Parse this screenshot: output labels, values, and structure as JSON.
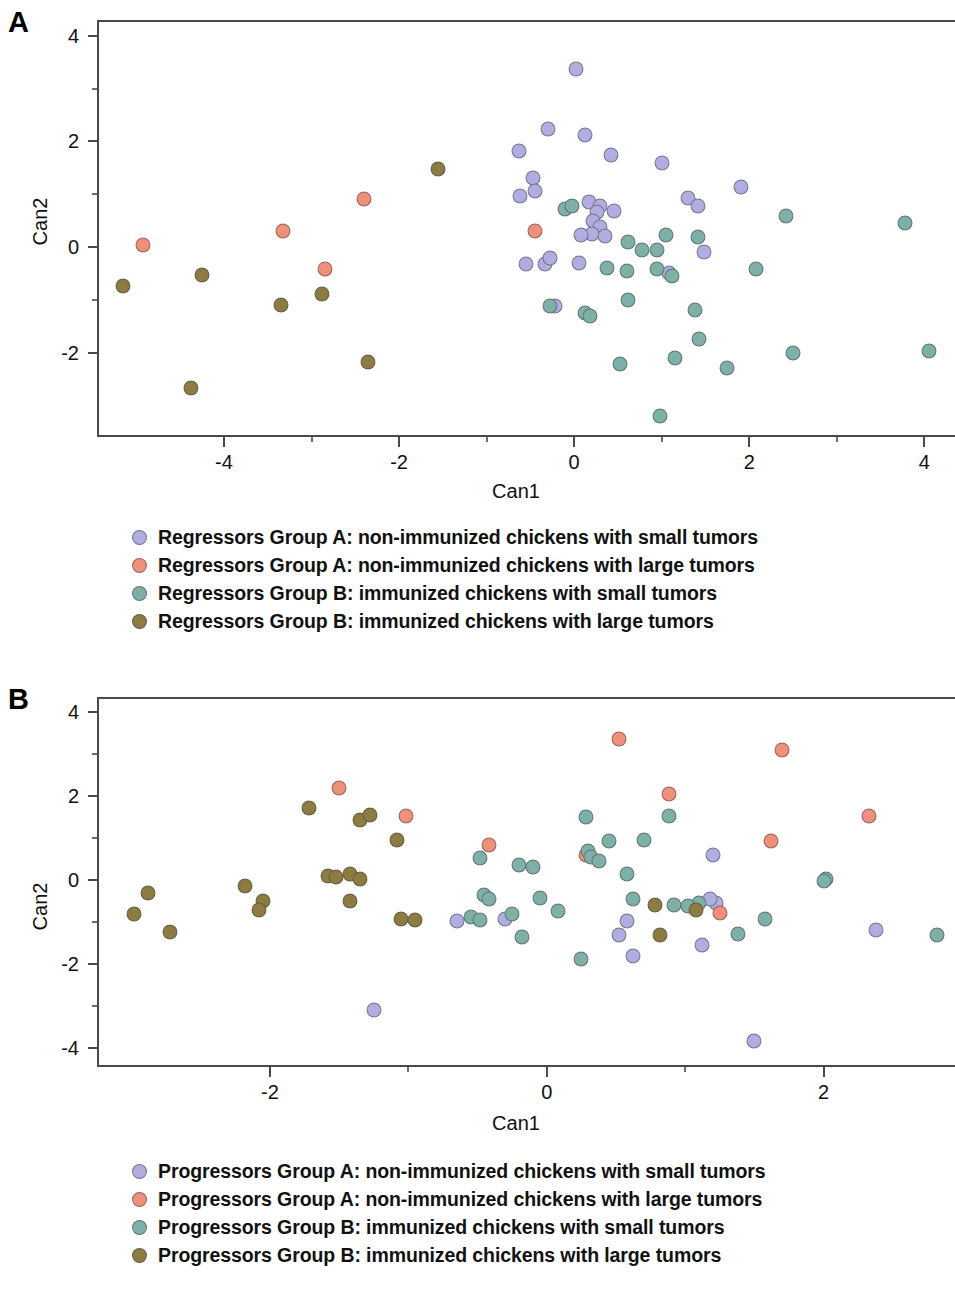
{
  "figure": {
    "panels": [
      {
        "letter": "A",
        "axes": {
          "xlabel": "Can1",
          "ylabel": "Can2",
          "xticks": [
            "-4",
            "-2",
            "0",
            "2",
            "4"
          ],
          "xtick_values": [
            -4,
            -2,
            0,
            2,
            4
          ],
          "yticks": [
            "4",
            "2",
            "0",
            "-2"
          ],
          "ytick_values": [
            4,
            2,
            0,
            -2
          ],
          "xlim": [
            -5.45,
            4.35
          ],
          "ylim": [
            -3.6,
            4.3
          ]
        },
        "legend": [
          {
            "label": "Regressors Group A: non-immunized chickens with small tumors",
            "color": "#b0aee0"
          },
          {
            "label": "Regressors Group A: non-immunized chickens with large tumors",
            "color": "#f08f7a"
          },
          {
            "label": "Regressors Group B: immunized chickens with small tumors",
            "color": "#7fb0a8"
          },
          {
            "label": "Regressors Group B: immunized chickens with large tumors",
            "color": "#8c7c42"
          }
        ]
      },
      {
        "letter": "B",
        "axes": {
          "xlabel": "Can1",
          "ylabel": "Can2",
          "xticks": [
            "-2",
            "0",
            "2"
          ],
          "xtick_values": [
            -2,
            0,
            2
          ],
          "yticks": [
            "4",
            "2",
            "0",
            "-2",
            "-4"
          ],
          "ytick_values": [
            4,
            2,
            0,
            -2,
            -4
          ],
          "xlim": [
            -3.25,
            2.95
          ],
          "ylim": [
            -4.45,
            4.35
          ]
        },
        "legend": [
          {
            "label": "Progressors Group A: non-immunized chickens with small tumors",
            "color": "#b0aee0"
          },
          {
            "label": "Progressors Group A: non-immunized chickens with large tumors",
            "color": "#f08f7a"
          },
          {
            "label": "Progressors Group B: immunized chickens with small tumors",
            "color": "#7fb0a8"
          },
          {
            "label": "Progressors Group B: immunized chickens with large tumors",
            "color": "#8c7c42"
          }
        ]
      }
    ]
  },
  "chart_data": [
    {
      "type": "scatter",
      "panel": "A",
      "title": "",
      "xlabel": "Can1",
      "ylabel": "Can2",
      "xlim": [
        -5.45,
        4.35
      ],
      "ylim": [
        -3.6,
        4.3
      ],
      "xticks": [
        -4,
        -2,
        0,
        2,
        4
      ],
      "yticks": [
        4,
        2,
        0,
        -2
      ],
      "grid": false,
      "legend_position": "below",
      "series": [
        {
          "name": "Regressors Group A: non-immunized chickens with small tumors",
          "color": "#b0aee0",
          "points": [
            [
              0.02,
              3.38
            ],
            [
              -0.3,
              2.24
            ],
            [
              0.12,
              2.13
            ],
            [
              -0.63,
              1.82
            ],
            [
              0.42,
              1.75
            ],
            [
              1.0,
              1.6
            ],
            [
              -0.47,
              1.3
            ],
            [
              1.9,
              1.13
            ],
            [
              -0.62,
              0.97
            ],
            [
              -0.45,
              1.06
            ],
            [
              1.3,
              0.92
            ],
            [
              1.42,
              0.77
            ],
            [
              0.17,
              0.85
            ],
            [
              0.3,
              0.78
            ],
            [
              0.26,
              0.66
            ],
            [
              0.45,
              0.68
            ],
            [
              0.22,
              0.5
            ],
            [
              0.3,
              0.38
            ],
            [
              0.2,
              0.25
            ],
            [
              0.08,
              0.22
            ],
            [
              0.35,
              0.2
            ],
            [
              -0.55,
              -0.33
            ],
            [
              -0.33,
              -0.33
            ],
            [
              -0.28,
              -0.2
            ],
            [
              0.05,
              -0.3
            ],
            [
              1.48,
              -0.1
            ],
            [
              1.08,
              -0.5
            ],
            [
              -0.22,
              -1.12
            ]
          ]
        },
        {
          "name": "Regressors Group A: non-immunized chickens with large tumors",
          "color": "#f08f7a",
          "points": [
            [
              -4.93,
              0.03
            ],
            [
              -3.33,
              0.3
            ],
            [
              -2.85,
              -0.42
            ],
            [
              -2.4,
              0.9
            ],
            [
              -0.45,
              0.3
            ]
          ]
        },
        {
          "name": "Regressors Group B: immunized chickens with small tumors",
          "color": "#7fb0a8",
          "points": [
            [
              2.42,
              0.58
            ],
            [
              3.78,
              0.45
            ],
            [
              1.05,
              0.22
            ],
            [
              1.42,
              0.18
            ],
            [
              0.62,
              0.1
            ],
            [
              0.78,
              -0.05
            ],
            [
              0.95,
              -0.06
            ],
            [
              -0.1,
              0.72
            ],
            [
              -0.02,
              0.78
            ],
            [
              0.6,
              -0.45
            ],
            [
              0.95,
              -0.42
            ],
            [
              1.12,
              -0.55
            ],
            [
              2.08,
              -0.42
            ],
            [
              0.38,
              -0.4
            ],
            [
              0.62,
              -1.0
            ],
            [
              -0.28,
              -1.12
            ],
            [
              0.12,
              -1.25
            ],
            [
              0.18,
              -1.3
            ],
            [
              1.38,
              -1.2
            ],
            [
              1.43,
              -1.75
            ],
            [
              2.5,
              -2.0
            ],
            [
              0.52,
              -2.22
            ],
            [
              1.15,
              -2.1
            ],
            [
              1.75,
              -2.3
            ],
            [
              4.05,
              -1.98
            ],
            [
              0.98,
              -3.2
            ]
          ]
        },
        {
          "name": "Regressors Group B: immunized chickens with large tumors",
          "color": "#8c7c42",
          "points": [
            [
              -1.55,
              1.47
            ],
            [
              -5.15,
              -0.73
            ],
            [
              -4.25,
              -0.53
            ],
            [
              -3.35,
              -1.1
            ],
            [
              -2.88,
              -0.9
            ],
            [
              -4.38,
              -2.67
            ],
            [
              -2.35,
              -2.18
            ]
          ]
        }
      ]
    },
    {
      "type": "scatter",
      "panel": "B",
      "title": "",
      "xlabel": "Can1",
      "ylabel": "Can2",
      "xlim": [
        -3.25,
        2.95
      ],
      "ylim": [
        -4.45,
        4.35
      ],
      "xticks": [
        -2,
        0,
        2
      ],
      "yticks": [
        4,
        2,
        0,
        -2,
        -4
      ],
      "grid": false,
      "legend_position": "below",
      "series": [
        {
          "name": "Progressors Group A: non-immunized chickens with small tumors",
          "color": "#b0aee0",
          "points": [
            [
              -0.65,
              -0.98
            ],
            [
              -0.3,
              -0.93
            ],
            [
              1.2,
              0.6
            ],
            [
              0.58,
              -0.97
            ],
            [
              0.52,
              -1.3
            ],
            [
              1.22,
              -0.55
            ],
            [
              1.18,
              -0.45
            ],
            [
              1.12,
              -1.55
            ],
            [
              0.62,
              -1.8
            ],
            [
              2.38,
              -1.2
            ],
            [
              -1.25,
              -3.1
            ],
            [
              1.5,
              -3.82
            ]
          ]
        },
        {
          "name": "Progressors Group A: non-immunized chickens with large tumors",
          "color": "#f08f7a",
          "points": [
            [
              -1.5,
              2.18
            ],
            [
              0.52,
              3.35
            ],
            [
              1.7,
              3.08
            ],
            [
              -1.02,
              1.52
            ],
            [
              0.88,
              2.05
            ],
            [
              2.33,
              1.52
            ],
            [
              -0.42,
              0.82
            ],
            [
              0.28,
              0.6
            ],
            [
              1.62,
              0.93
            ],
            [
              1.25,
              -0.78
            ]
          ]
        },
        {
          "name": "Progressors Group B: immunized chickens with small tumors",
          "color": "#7fb0a8",
          "points": [
            [
              -0.48,
              0.52
            ],
            [
              0.28,
              1.5
            ],
            [
              0.88,
              1.52
            ],
            [
              0.45,
              0.92
            ],
            [
              0.7,
              0.95
            ],
            [
              0.3,
              0.68
            ],
            [
              0.32,
              0.55
            ],
            [
              0.38,
              0.45
            ],
            [
              0.58,
              0.13
            ],
            [
              -0.2,
              0.35
            ],
            [
              -0.1,
              0.3
            ],
            [
              -0.45,
              -0.35
            ],
            [
              -0.42,
              -0.45
            ],
            [
              -0.05,
              -0.42
            ],
            [
              0.08,
              -0.75
            ],
            [
              -0.25,
              -0.8
            ],
            [
              0.92,
              -0.6
            ],
            [
              1.1,
              -0.55
            ],
            [
              1.02,
              -0.62
            ],
            [
              0.62,
              -0.45
            ],
            [
              -0.55,
              -0.88
            ],
            [
              -0.48,
              -0.95
            ],
            [
              -0.18,
              -1.35
            ],
            [
              1.38,
              -1.28
            ],
            [
              0.25,
              -1.88
            ],
            [
              2.02,
              0.02
            ],
            [
              2.0,
              -0.02
            ],
            [
              2.82,
              -1.32
            ],
            [
              1.58,
              -0.92
            ]
          ]
        },
        {
          "name": "Progressors Group B: immunized chickens with large tumors",
          "color": "#8c7c42",
          "points": [
            [
              -1.72,
              1.7
            ],
            [
              -1.35,
              1.42
            ],
            [
              -1.28,
              1.55
            ],
            [
              -1.08,
              0.95
            ],
            [
              -2.98,
              -0.8
            ],
            [
              -2.88,
              -0.3
            ],
            [
              -2.72,
              -1.25
            ],
            [
              -2.18,
              -0.15
            ],
            [
              -2.05,
              -0.5
            ],
            [
              -2.08,
              -0.72
            ],
            [
              -1.58,
              0.1
            ],
            [
              -1.52,
              0.08
            ],
            [
              -1.42,
              0.15
            ],
            [
              -1.35,
              0.02
            ],
            [
              -1.42,
              -0.5
            ],
            [
              -1.05,
              -0.92
            ],
            [
              -0.95,
              -0.95
            ],
            [
              0.78,
              -0.6
            ],
            [
              0.82,
              -1.3
            ],
            [
              1.08,
              -0.72
            ]
          ]
        }
      ]
    }
  ]
}
